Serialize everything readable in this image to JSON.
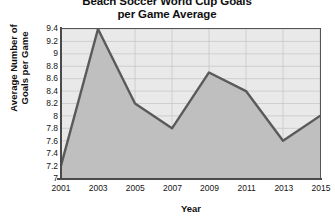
{
  "chart_data": {
    "type": "area",
    "title": "Beach Soccer World Cup Goals\nper Game Average",
    "xlabel": "Year",
    "ylabel": "Average Number of\nGoals per Game",
    "categories": [
      "2001",
      "2003",
      "2005",
      "2007",
      "2009",
      "2011",
      "2013",
      "2015"
    ],
    "x": [
      2001,
      2003,
      2005,
      2007,
      2009,
      2011,
      2013,
      2015
    ],
    "values": [
      7.2,
      9.4,
      8.2,
      7.8,
      8.7,
      8.4,
      7.6,
      8.0
    ],
    "series": [
      {
        "name": "Goals per Game Average",
        "values": [
          7.2,
          9.4,
          8.2,
          7.8,
          8.7,
          8.4,
          7.6,
          8.0
        ]
      }
    ],
    "ylim": [
      7.0,
      9.4
    ],
    "xlim": [
      2001,
      2015
    ],
    "yticks": [
      "9.4",
      "9.2",
      "9",
      "8.8",
      "8.6",
      "8.4",
      "8.2",
      "8",
      "7.8",
      "7.6",
      "7.4",
      "7.2",
      "7"
    ],
    "ytick_values": [
      9.4,
      9.2,
      9.0,
      8.8,
      8.6,
      8.4,
      8.2,
      8.0,
      7.8,
      7.6,
      7.4,
      7.2,
      7.0
    ],
    "xticks": [
      "2001",
      "2003",
      "2005",
      "2007",
      "2009",
      "2011",
      "2013",
      "2015"
    ],
    "grid": true,
    "legend": false,
    "legend_position": "none",
    "colors": {
      "line": "#5a5a5a",
      "fill": "#bdbdbd",
      "plot_background": "#e9e9e9",
      "grid": "#c4c4c4",
      "axis": "#4a4a4a",
      "text": "#101010",
      "page_background": "#ffffff"
    }
  }
}
